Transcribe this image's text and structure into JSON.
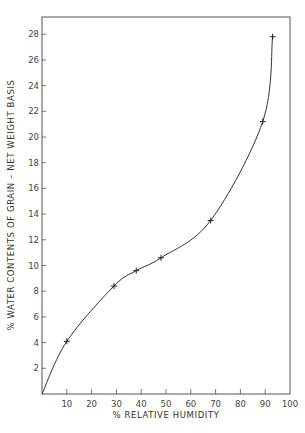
{
  "chart_data": {
    "type": "line",
    "title": "",
    "xlabel": "% RELATIVE HUMIDITY",
    "ylabel": "% WATER CONTENTS OF GRAIN – NET WEIGHT BASIS",
    "xlim": [
      0,
      100
    ],
    "ylim": [
      0,
      29
    ],
    "x_ticks": [
      10,
      20,
      30,
      40,
      50,
      60,
      70,
      80,
      90,
      100
    ],
    "y_ticks": [
      2,
      4,
      6,
      8,
      10,
      12,
      14,
      16,
      18,
      20,
      22,
      24,
      26,
      28
    ],
    "grid": false,
    "legend": null,
    "series": [
      {
        "name": "Water content of grain",
        "marker": "+",
        "curve": "smooth",
        "x": [
          0,
          10,
          29,
          38,
          48,
          68,
          89,
          93
        ],
        "values": [
          0,
          4.1,
          8.4,
          9.6,
          10.6,
          13.5,
          21.2,
          27.8
        ]
      }
    ]
  },
  "colors": {
    "line": "#333333",
    "axis": "#555555",
    "background": "#ffffff"
  }
}
